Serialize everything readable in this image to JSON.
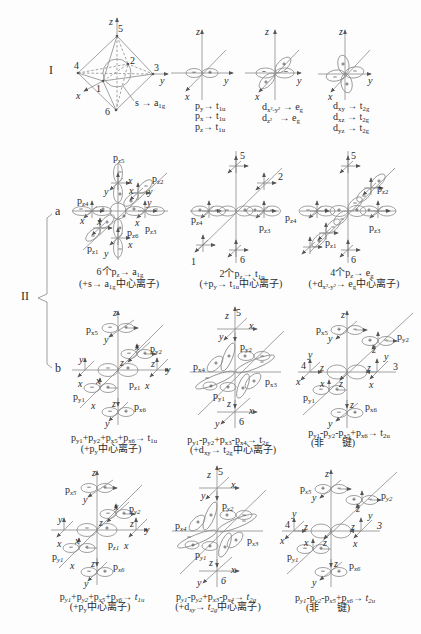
{
  "figure": {
    "markers": {
      "row1": "I",
      "row2": "II",
      "sub_a": "a",
      "sub_b": "b"
    },
    "r1": {
      "octa": {
        "axes": {
          "x": "x",
          "y": "y",
          "z": "z"
        },
        "vertices": {
          "v1": "1",
          "v2": "2",
          "v3": "3",
          "v4": "4",
          "v5": "5",
          "v6": "6"
        },
        "caption": [
          "s → a",
          "1g"
        ]
      },
      "p": {
        "axes": {
          "x": "x",
          "y": "y",
          "z": "z"
        },
        "lines": [
          [
            "p",
            "y",
            "→ t",
            "1u"
          ],
          [
            "p",
            "x",
            "→ t",
            "1u"
          ],
          [
            "p",
            "z",
            "→ t",
            "1u"
          ]
        ]
      },
      "eg": {
        "axes": {
          "x": "x",
          "y": "y",
          "z": "z"
        },
        "lines": [
          [
            "d",
            "x²-y²",
            " → e",
            "g"
          ],
          [
            "d",
            "z²",
            "   → e",
            "g"
          ]
        ]
      },
      "t2g": {
        "axes": {
          "x": "x",
          "y": "y",
          "z": "z"
        },
        "lines": [
          [
            "d",
            "xy",
            " → t",
            "2g"
          ],
          [
            "d",
            "xz",
            " → t",
            "2g"
          ],
          [
            "d",
            "yz",
            " → t",
            "2g"
          ]
        ]
      }
    },
    "r2a": {
      "d1": {
        "labels": [
          [
            "p",
            "z5"
          ],
          [
            "p",
            "z2"
          ],
          [
            "p",
            "z4"
          ],
          [
            "p",
            "z3"
          ],
          [
            "p",
            "z1"
          ],
          [
            "p",
            "z6"
          ]
        ],
        "local_axes": [
          "x",
          "y",
          "x",
          "y",
          "y",
          "x",
          "x",
          "x",
          "x",
          "y"
        ],
        "caption": [
          [
            "6个p",
            "z",
            "→ a",
            "1g"
          ],
          [
            "(+s→ a",
            "1g",
            "中心离子)"
          ]
        ]
      },
      "d2": {
        "positions": [
          "5",
          "2",
          "1",
          "6"
        ],
        "labels": [
          [
            "p",
            "z4"
          ],
          [
            "p",
            "z3"
          ]
        ],
        "caption": [
          [
            "2个p",
            "z",
            "→ t",
            "1u"
          ],
          [
            "(+p",
            "y",
            "→ t",
            "1u",
            "中心离子)"
          ]
        ]
      },
      "d3": {
        "positions": [
          "5",
          "6"
        ],
        "labels": [
          [
            "p",
            "z2"
          ],
          [
            "p",
            "z4"
          ],
          [
            "p",
            "z3"
          ],
          [
            "p",
            "z1"
          ]
        ],
        "caption": [
          [
            "4个p",
            "z",
            "→ e",
            "g"
          ],
          [
            "(+d",
            "x²-y²",
            "→ e",
            "g",
            "中心离子)"
          ]
        ]
      }
    },
    "r2b": {
      "d1": {
        "labels": [
          [
            "p",
            "x5"
          ],
          [
            "p",
            "y2"
          ],
          [
            "p",
            "z1"
          ],
          [
            "p",
            "y1"
          ],
          [
            "p",
            "x6"
          ]
        ],
        "local_axes": [
          "z",
          "y",
          "x",
          "z",
          "y",
          "x",
          "z",
          "x",
          "y",
          "x",
          "x",
          "z",
          "y"
        ],
        "caption": [
          [
            "p",
            "y1",
            "+p",
            "y2",
            "+p",
            "x5",
            "+p",
            "x6",
            "→ t",
            "1u"
          ],
          [
            "(+p",
            "y",
            "中心离子)"
          ]
        ]
      },
      "d2": {
        "positions": [
          "5",
          "6"
        ],
        "labels": [
          [
            "p",
            "y2"
          ],
          [
            "p",
            "x4"
          ],
          [
            "p",
            "x3"
          ],
          [
            "p",
            "y1"
          ]
        ],
        "local_axes": [
          "z",
          "x",
          "y",
          "z",
          "x",
          "y"
        ],
        "caption": [
          [
            "p",
            "y1",
            "-p",
            "y2",
            "+p",
            "x3",
            "-p",
            "x4",
            "→ t",
            "2g"
          ],
          [
            "(+d",
            "xy",
            "→ t",
            "2g",
            "中心离子)"
          ]
        ]
      },
      "d3": {
        "positions": [
          "4",
          "3"
        ],
        "labels": [
          [
            "p",
            "x5"
          ],
          [
            "p",
            "y2"
          ],
          [
            "p",
            "y1"
          ],
          [
            "p",
            "x6"
          ]
        ],
        "local_axes": [
          "z",
          "y",
          "z",
          "y",
          "z",
          "x",
          "y",
          "z",
          "x",
          "z",
          "x",
          "z",
          "y"
        ],
        "caption": [
          [
            "p",
            "y1",
            "-p",
            "y2",
            "-p",
            "x5",
            "+p",
            "x6",
            "→ t",
            "2u"
          ],
          [
            "(非       键)"
          ]
        ]
      }
    },
    "r3": {
      "d1": {
        "labels": [
          [
            "p",
            "x5"
          ],
          [
            "p",
            "y2"
          ],
          [
            "p",
            "z1"
          ],
          [
            "p",
            "y1"
          ],
          [
            "p",
            "x6"
          ]
        ],
        "local_axes": [
          "z",
          "y",
          "x",
          "z",
          "y",
          "x",
          "z",
          "x",
          "y",
          "x",
          "x",
          "z",
          "y"
        ],
        "caption": [
          [
            "p",
            "y1",
            "+p",
            "y2",
            "+p",
            "x5",
            "+p",
            "x6",
            "→ t",
            "1u"
          ],
          [
            "(+p",
            "y",
            "中心离子)"
          ]
        ]
      },
      "d2": {
        "positions": [
          "5",
          "6"
        ],
        "labels": [
          [
            "p",
            "y2"
          ],
          [
            "p",
            "x4"
          ],
          [
            "p",
            "x3"
          ],
          [
            "p",
            "y1"
          ]
        ],
        "local_axes": [
          "z",
          "x",
          "y",
          "z",
          "x",
          "y"
        ],
        "caption": [
          [
            "p",
            "y1",
            "-p",
            "y2",
            "+p",
            "x3",
            "-p",
            "x4",
            "→ t",
            "2g"
          ],
          [
            "(+d",
            "xy",
            "→ t",
            "2g",
            "中心离子)"
          ]
        ]
      },
      "d3": {
        "positions": [
          "4",
          "3"
        ],
        "labels": [
          [
            "p",
            "x5"
          ],
          [
            "p",
            "y2"
          ],
          [
            "p",
            "y1"
          ],
          [
            "p",
            "x6"
          ]
        ],
        "local_axes": [
          "z",
          "y",
          "z",
          "y",
          "z",
          "x",
          "y",
          "z",
          "x",
          "z",
          "x",
          "z",
          "y"
        ],
        "caption": [
          [
            "p",
            "y1",
            "-p",
            "y2",
            "-p",
            "x5",
            "+p",
            "x6",
            "→ t",
            "2u"
          ],
          [
            "(非       键)"
          ]
        ]
      }
    }
  }
}
